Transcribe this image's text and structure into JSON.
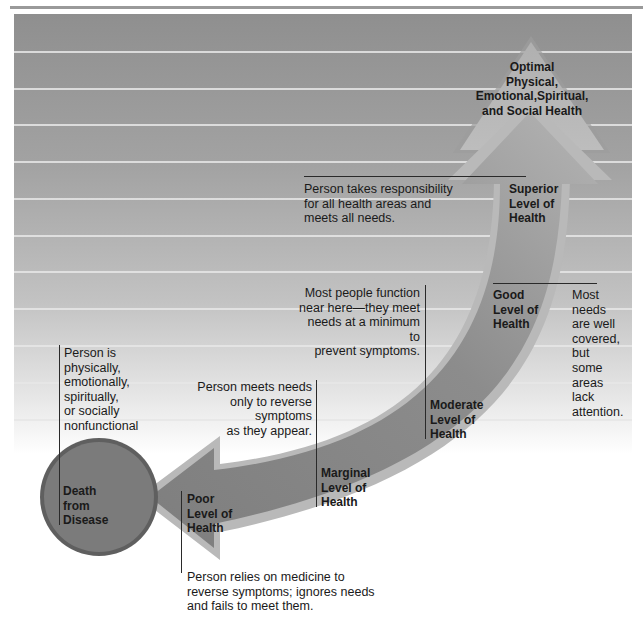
{
  "diagram": {
    "type": "health-continuum",
    "colors": {
      "background_top": "#8f8f8f",
      "background_bottom": "#ffffff",
      "arrow_body": "#8a8a8a",
      "arrow_edge": "#b5b5b5",
      "circle_fill": "#7a7a7a",
      "circle_edge": "#5e5e5e",
      "triangle_fill": "#b8b8b8",
      "stripe": "#e6e6e6"
    },
    "apex": {
      "label": [
        "Optimal",
        "Physical,",
        "Emotional,Spiritual,",
        "and Social Health"
      ]
    },
    "endpoint": {
      "label": [
        "Death",
        "from",
        "Disease"
      ],
      "description": [
        "Person is",
        "physically,",
        "emotionally,",
        "spiritually,",
        "or socially",
        "nonfunctional"
      ]
    },
    "levels": [
      {
        "name": [
          "Superior",
          "Level of",
          "Health"
        ],
        "description": [
          "Person takes responsibility",
          "for all health areas and",
          "meets all needs."
        ]
      },
      {
        "name": [
          "Good",
          "Level of",
          "Health"
        ],
        "description": [
          "Most",
          "needs",
          "are well",
          "covered,",
          "but",
          "some",
          "areas",
          "lack",
          "attention."
        ]
      },
      {
        "name": [
          "Moderate",
          "Level of",
          "Health"
        ],
        "description": [
          "Most people function",
          "near here—they meet",
          "needs at a minimum to",
          "prevent symptoms."
        ]
      },
      {
        "name": [
          "Marginal",
          "Level of",
          "Health"
        ],
        "description": [
          "Person meets needs",
          "only to reverse symptoms",
          "as they appear."
        ]
      },
      {
        "name": [
          "Poor",
          "Level of",
          "Health"
        ],
        "description": [
          "Person  relies on medicine to",
          "reverse symptoms; ignores needs",
          "and fails to meet them."
        ]
      }
    ]
  }
}
